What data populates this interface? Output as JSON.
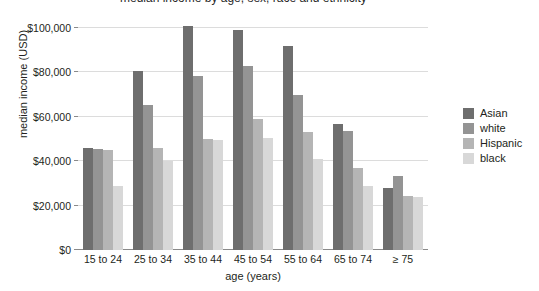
{
  "title": "median income by age, sex, race and ethnicity",
  "chart_data": {
    "type": "bar",
    "title": "median income by age, sex, race and ethnicity",
    "xlabel": "age (years)",
    "ylabel": "median income (USD)",
    "categories": [
      "15 to 24",
      "25 to 34",
      "35 to 44",
      "45 to 54",
      "55 to 64",
      "65 to 74",
      "≥ 75"
    ],
    "series": [
      {
        "name": "Asian",
        "color": "#6e6e6e",
        "values": [
          46000,
          80500,
          101000,
          99000,
          92000,
          57000,
          28000
        ]
      },
      {
        "name": "white",
        "color": "#949494",
        "values": [
          45500,
          65500,
          78500,
          83000,
          70000,
          53500,
          33500
        ]
      },
      {
        "name": "Hispanic",
        "color": "#b5b5b5",
        "values": [
          45000,
          46000,
          50000,
          59000,
          53000,
          37000,
          24500
        ]
      },
      {
        "name": "black",
        "color": "#d8d8d8",
        "values": [
          29000,
          40000,
          49500,
          50500,
          41000,
          29000,
          24000
        ]
      }
    ],
    "ylim": [
      0,
      105000
    ],
    "yticks": [
      0,
      20000,
      40000,
      60000,
      80000,
      100000
    ],
    "ytick_labels": [
      "$0",
      "$20,000",
      "$40,000",
      "$60,000",
      "$80,000",
      "$100,000"
    ],
    "grid": true,
    "legend_position": "right",
    "legend_entries": [
      "Asian",
      "white",
      "Hispanic",
      "black"
    ]
  }
}
